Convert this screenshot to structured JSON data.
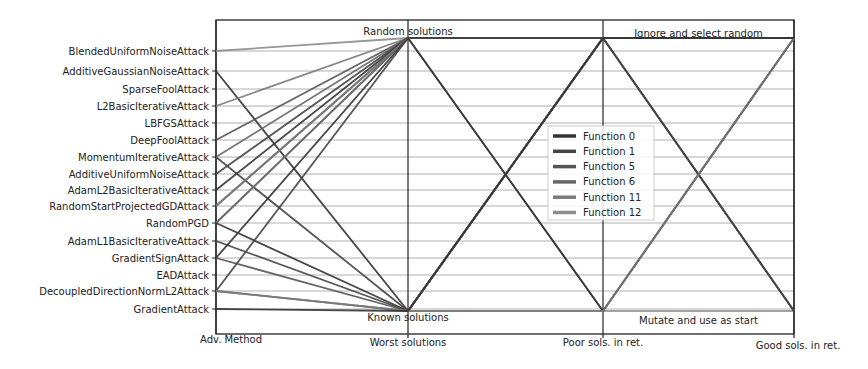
{
  "chart_data": {
    "type": "parallel_coordinates",
    "title": "",
    "axes": [
      "Adv. Method",
      "Worst solutions",
      "Poor sols. in ret.",
      "Good sols. in ret."
    ],
    "adv_methods": [
      "BlendedUniformNoiseAttack",
      "AdditiveGaussianNoiseAttack",
      "SparseFoolAttack",
      "L2BasicIterativeAttack",
      "LBFGSAttack",
      "DeepFoolAttack",
      "MomentumIterativeAttack",
      "AdditiveUniformNoiseAttack",
      "AdamL2BasicIterativeAttack",
      "RandomStartProjectedGDAttack",
      "RandomPGD",
      "AdamL1BasicIterativeAttack",
      "GradientSignAttack",
      "EADAttack",
      "DecoupledDirectionNormL2Attack",
      "GradientAttack"
    ],
    "level_labels": {
      "worst_top": "Random solutions",
      "worst_bottom": "Known solutions",
      "good_top": "Ignore and select random",
      "good_bottom": "Mutate and use as start"
    },
    "legend": {
      "position": "center",
      "entries": [
        {
          "name": "Function 0",
          "color": "#333333"
        },
        {
          "name": "Function 1",
          "color": "#444444"
        },
        {
          "name": "Function 5",
          "color": "#555555"
        },
        {
          "name": "Function 6",
          "color": "#666666"
        },
        {
          "name": "Function 11",
          "color": "#7a7a7a"
        },
        {
          "name": "Function 12",
          "color": "#8c8c8c"
        }
      ]
    },
    "grid": true,
    "lines": [
      {
        "method": 0,
        "worst": "top",
        "poor": "top",
        "good": "top",
        "color": "#8c8c8c"
      },
      {
        "method": 1,
        "worst": "bottom",
        "poor": "top",
        "good": "bottom",
        "color": "#333333"
      },
      {
        "method": 3,
        "worst": "top",
        "poor": "top",
        "good": "top",
        "color": "#7a7a7a"
      },
      {
        "method": 5,
        "worst": "top",
        "poor": "bottom",
        "good": "top",
        "color": "#555555"
      },
      {
        "method": 6,
        "worst": "bottom",
        "poor": "top",
        "good": "top",
        "color": "#444444"
      },
      {
        "method": 6,
        "worst": "top",
        "poor": "top",
        "good": "top",
        "color": "#666666"
      },
      {
        "method": 7,
        "worst": "top",
        "poor": "top",
        "good": "top",
        "color": "#444444"
      },
      {
        "method": 8,
        "worst": "top",
        "poor": "bottom",
        "good": "top",
        "color": "#333333"
      },
      {
        "method": 9,
        "worst": "top",
        "poor": "top",
        "good": "bottom",
        "color": "#555555"
      },
      {
        "method": 9,
        "worst": "top",
        "poor": "top",
        "good": "top",
        "color": "#7a7a7a"
      },
      {
        "method": 10,
        "worst": "top",
        "poor": "top",
        "good": "top",
        "color": "#8c8c8c"
      },
      {
        "method": 10,
        "worst": "top",
        "poor": "top",
        "good": "top",
        "color": "#666666"
      },
      {
        "method": 10,
        "worst": "bottom",
        "poor": "top",
        "good": "top",
        "color": "#333333"
      },
      {
        "method": 11,
        "worst": "bottom",
        "poor": "top",
        "good": "bottom",
        "color": "#444444"
      },
      {
        "method": 12,
        "worst": "bottom",
        "poor": "top",
        "good": "top",
        "color": "#555555"
      },
      {
        "method": 12,
        "worst": "top",
        "poor": "top",
        "good": "top",
        "color": "#333333"
      },
      {
        "method": 14,
        "worst": "top",
        "poor": "top",
        "good": "top",
        "color": "#444444"
      },
      {
        "method": 14,
        "worst": "bottom",
        "poor": "top",
        "good": "top",
        "color": "#666666"
      },
      {
        "method": 14,
        "worst": "bottom",
        "poor": "bottom",
        "good": "top",
        "color": "#7a7a7a"
      },
      {
        "method": 15,
        "worst": "bottom",
        "poor": "top",
        "good": "top",
        "color": "#333333"
      }
    ]
  },
  "layout": {
    "axis_x": [
      216,
      408,
      603,
      794
    ],
    "frame_top": 20,
    "frame_bottom": 334,
    "level_top_y": 38,
    "level_bottom_y": 311,
    "method_y": [
      51,
      71,
      89,
      106,
      123,
      140,
      157,
      174,
      190,
      206,
      223,
      241,
      258,
      275,
      291,
      309
    ],
    "legend_box": {
      "x": 548,
      "y": 126,
      "w": 106,
      "h": 94
    }
  }
}
